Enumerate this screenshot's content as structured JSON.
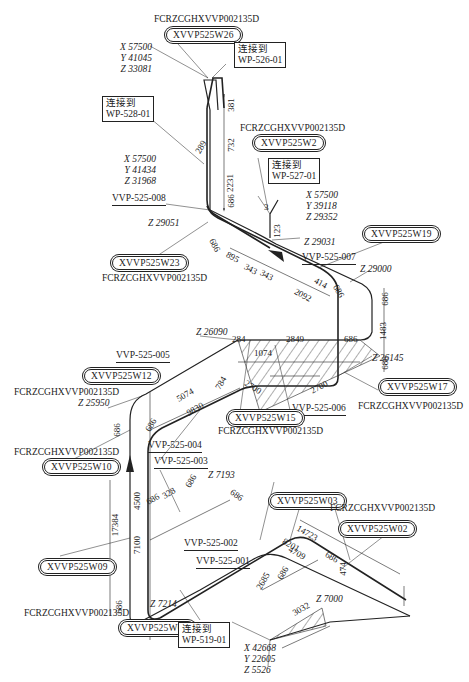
{
  "drawing": {
    "type": "piping isometric",
    "weld_spec": "FCRZCGHXVVP002135D",
    "connections": [
      {
        "id": "conn-526",
        "title": "连接到",
        "target": "WP-526-01"
      },
      {
        "id": "conn-528",
        "title": "连接到",
        "target": "WP-528-01"
      },
      {
        "id": "conn-527",
        "title": "连接到",
        "target": "WP-527-01"
      },
      {
        "id": "conn-519",
        "title": "连接到",
        "target": "WP-519-01"
      }
    ],
    "coordinates": [
      {
        "id": "coord-top",
        "x": "X 57500",
        "y": "Y 41045",
        "z": "Z 33081"
      },
      {
        "id": "coord-528",
        "x": "X 57500",
        "y": "Y 41434",
        "z": "Z 31968"
      },
      {
        "id": "coord-527",
        "x": "X 57500",
        "y": "Y 39118",
        "z": "Z 29352"
      },
      {
        "id": "coord-bottom",
        "x": "X 42668",
        "y": "Y 22605",
        "z": "Z 5526"
      }
    ],
    "welds": [
      {
        "id": "W26",
        "label": "XVVP525W26",
        "spec": "FCRZCGHXVVP002135D"
      },
      {
        "id": "W24",
        "label": "XVVP525W2",
        "spec": "FCRZCGHXVVP002135D"
      },
      {
        "id": "W23",
        "label": "XVVP525W23",
        "spec": "FCRZCGHXVVP002135D"
      },
      {
        "id": "W19",
        "label": "XVVP525W19"
      },
      {
        "id": "W12",
        "label": "XVVP525W12",
        "spec": "FCRZCGHXVVP002135D"
      },
      {
        "id": "W15",
        "label": "XVVP525W15",
        "spec": "FCRZCGHXVVP002135D"
      },
      {
        "id": "W17",
        "label": "XVVP525W17",
        "spec": "FCRZCGHXVVP002135D"
      },
      {
        "id": "W10",
        "label": "XVVP525W10",
        "spec": "FCRZCGHXVVP002135D"
      },
      {
        "id": "W09",
        "label": "XVVP525W09",
        "spec": "FCRZCGHXVVP002135D"
      },
      {
        "id": "W06",
        "label": "XVVP525W06"
      },
      {
        "id": "W03",
        "label": "XVVP525W03",
        "spec": "FCRZCGHXVVP002135D"
      },
      {
        "id": "W02",
        "label": "XVVP525W02"
      }
    ],
    "line_numbers": [
      "VVP-525-008",
      "VVP-525-007",
      "VVP-525-006",
      "VVP-525-005",
      "VVP-525-004",
      "VVP-525-003",
      "VVP-525-002",
      "VVP-525-001"
    ],
    "elevations": [
      "Z 29051",
      "Z 29031",
      "Z 29000",
      "Z 26090",
      "Z 26145",
      "Z 25950",
      "Z 7193",
      "Z 7214",
      "Z 7000"
    ],
    "dimensions": {
      "top_vertical": [
        "381",
        "732",
        "2231",
        "686"
      ],
      "top_angle": "289",
      "upper_horizontal": [
        "686",
        "895",
        "343",
        "343",
        "2092",
        "414",
        "686"
      ],
      "small_branch": [
        "3",
        "123"
      ],
      "right_vertical": [
        "686",
        "1483",
        "686"
      ],
      "middle_top": [
        "284",
        "2849",
        "686",
        "1074"
      ],
      "middle_slope": [
        "2700",
        "2700"
      ],
      "left_run": [
        "5074",
        "9830",
        "784",
        "686"
      ],
      "left_vertical": [
        "686",
        "4500",
        "7100",
        "17384",
        "686"
      ],
      "lower_run": [
        "686",
        "328",
        "686",
        "686"
      ],
      "lower_right": [
        "14723",
        "8201",
        "4709",
        "686",
        "474",
        "2685",
        "686",
        "3032"
      ]
    }
  }
}
